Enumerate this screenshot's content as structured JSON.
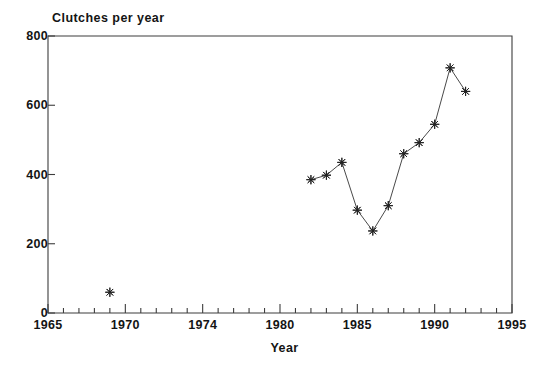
{
  "chart_data": {
    "type": "scatter",
    "title": "",
    "ylabel": "Clutches per year",
    "xlabel": "Year",
    "xlim": [
      1965,
      1995
    ],
    "ylim": [
      0,
      800
    ],
    "grid": false,
    "legend": null,
    "marker": "asterisk-star",
    "xticks": [
      1965,
      1970,
      1974,
      1980,
      1985,
      1990,
      1995
    ],
    "xtick_labels": [
      "1965",
      "1970",
      "1974",
      "1980",
      "1985",
      "1990",
      "1995"
    ],
    "xtick_positions": [
      1965,
      1970,
      1975,
      1980,
      1985,
      1990,
      1995
    ],
    "x_minor_tick_interval": 1,
    "yticks": [
      0,
      200,
      400,
      600,
      800
    ],
    "ytick_labels": [
      "0",
      "200",
      "400",
      "600",
      "800"
    ],
    "series": [
      {
        "name": "isolated-point",
        "connected": false,
        "x": [
          1969
        ],
        "values": [
          60
        ]
      },
      {
        "name": "main-series",
        "connected": true,
        "x": [
          1982,
          1983,
          1984,
          1985,
          1986,
          1987,
          1988,
          1989,
          1990,
          1991,
          1992
        ],
        "values": [
          385,
          398,
          435,
          297,
          237,
          310,
          460,
          492,
          545,
          708,
          640
        ]
      }
    ],
    "colors": {
      "line": "#4a4a4a",
      "marker": "#222222",
      "axis": "#3d3d3d",
      "background": "#ffffff",
      "text": "#141414"
    }
  },
  "axis": {
    "ylabel_text": "Clutches per year",
    "xlabel_text": "Year"
  }
}
